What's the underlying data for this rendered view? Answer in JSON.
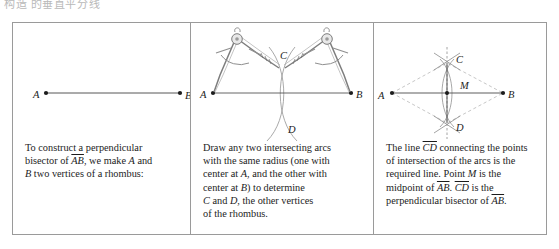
{
  "header_cut_text": "构造  的垂直平分线",
  "figure": {
    "columns": [
      {
        "id": "step-1",
        "caption_lines": [
          "To construct a perpendicular",
          "bisector of AB, we make A and",
          "B two vertices of a rhombus:"
        ],
        "caption_text": "To construct a perpendicular bisector of AB, we make A and B two vertices of a rhombus:",
        "diagram": {
          "kind": "segment",
          "points": [
            {
              "name": "A",
              "label": "A",
              "x": 33,
              "y": 70
            },
            {
              "name": "B",
              "label": "B",
              "x": 167,
              "y": 70
            }
          ]
        }
      },
      {
        "id": "step-2",
        "caption_lines": [
          "Draw any two intersecting arcs",
          "with the same radius (one with",
          "center at A, and the other with",
          "center at B) to determine",
          "C and D, the other vertices",
          "of the rhombus."
        ],
        "caption_text": "Draw any two intersecting arcs with the same radius (one with center at A, and the other with center at B) to determine C and D, the other vertices of the rhombus.",
        "diagram": {
          "kind": "compass-arcs",
          "points": [
            {
              "name": "A",
              "label": "A",
              "x": 22,
              "y": 70
            },
            {
              "name": "B",
              "label": "B",
              "x": 160,
              "y": 70
            },
            {
              "name": "C",
              "label": "C",
              "x": 91,
              "y": 38
            },
            {
              "name": "D",
              "label": "D",
              "x": 91,
              "y": 103
            }
          ],
          "tools": [
            "compass-left",
            "compass-right"
          ]
        }
      },
      {
        "id": "step-3",
        "caption_lines": [
          "The line CD connecting the points",
          "of intersection of the arcs is the",
          "required line. Point M is the",
          "midpoint of AB. CD is the",
          "perpendicular bisector of AB."
        ],
        "caption_text": "The line CD connecting the points of intersection of the arcs is the required line. Point M is the midpoint of AB. CD is the perpendicular bisector of AB.",
        "diagram": {
          "kind": "rhombus-bisector",
          "points": [
            {
              "name": "A",
              "label": "A",
              "x": 18,
              "y": 70
            },
            {
              "name": "B",
              "label": "B",
              "x": 129,
              "y": 70
            },
            {
              "name": "C",
              "label": "C",
              "x": 73,
              "y": 40
            },
            {
              "name": "D",
              "label": "D",
              "x": 73,
              "y": 100
            },
            {
              "name": "M",
              "label": "M",
              "x": 73,
              "y": 70
            }
          ]
        }
      }
    ]
  },
  "colors": {
    "frame": "#9a9a9a",
    "ink": "#1c1c1c",
    "construction_line": "#555555",
    "arc": "#8a8a8a",
    "dashed_rhombus": "#b8b8b8",
    "tool_metal": "#9b9b9b",
    "background": "#ffffff"
  }
}
